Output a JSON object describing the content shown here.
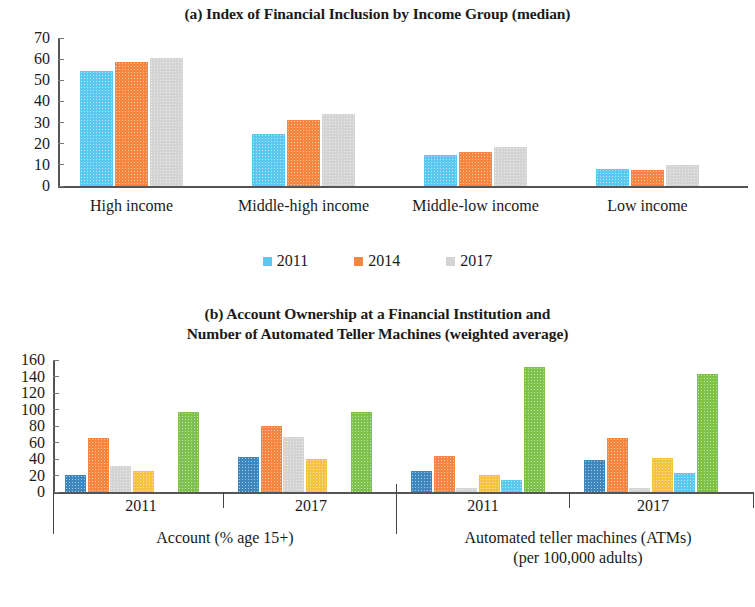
{
  "chart_data": [
    {
      "id": "panel_a",
      "type": "bar",
      "title": "(a) Index of Financial Inclusion by Income Group (median)",
      "xlabel": "",
      "ylabel": "",
      "ylim": [
        0,
        70
      ],
      "yticks": [
        0,
        10,
        20,
        30,
        40,
        50,
        60,
        70
      ],
      "grid": false,
      "legend_position": "bottom",
      "categories": [
        "High income",
        "Middle-high income",
        "Middle-low income",
        "Low income"
      ],
      "series": [
        {
          "name": "2011",
          "color": "#5BC8F0",
          "values": [
            54.3,
            24.6,
            14.8,
            7.9
          ]
        },
        {
          "name": "2014",
          "color": "#F5853F",
          "values": [
            58.8,
            31.2,
            16.2,
            7.6
          ]
        },
        {
          "name": "2017",
          "color": "#D4D4D4",
          "values": [
            60.4,
            34.2,
            18.6,
            10.1
          ]
        }
      ]
    },
    {
      "id": "panel_b",
      "type": "bar",
      "title_line1": "(b) Account Ownership at a Financial Institution and",
      "title_line2": "Number of Automated Teller Machines (weighted average)",
      "ylim": [
        0,
        160
      ],
      "yticks": [
        0,
        20,
        40,
        60,
        80,
        100,
        120,
        140,
        160
      ],
      "grid": false,
      "legend_position": "bottom",
      "groups": [
        {
          "label": "2011",
          "section": "Account (% age 15+)"
        },
        {
          "label": "2017",
          "section": "Account (% age 15+)"
        },
        {
          "label": "2011",
          "section": "Automated teller machines (ATMs) (per 100,000 adults)"
        },
        {
          "label": "2017",
          "section": "Automated teller machines (ATMs) (per 100,000 adults)"
        }
      ],
      "sections": [
        {
          "line1": "Account (% age 15+)",
          "line2": ""
        },
        {
          "line1": "Automated teller machines (ATMs)",
          "line2": "(per 100,000 adults)"
        }
      ],
      "categories": [
        "2011",
        "2017",
        "2011",
        "2017"
      ],
      "series": [
        {
          "name": "Central Asia",
          "color": "#3D87BE",
          "values": [
            21,
            42,
            26,
            39
          ]
        },
        {
          "name": "East Asia",
          "color": "#F5853F",
          "values": [
            66,
            80,
            44,
            65
          ]
        },
        {
          "name": "South Asia",
          "color": "#D4D4D4",
          "values": [
            31,
            67,
            5,
            5
          ]
        },
        {
          "name": "Southeast Asia",
          "color": "#F5C242",
          "values": [
            25,
            40,
            21,
            41
          ]
        },
        {
          "name": "The Pacific",
          "color": "#5BC8F0",
          "values": [
            0,
            0,
            15,
            23
          ]
        },
        {
          "name": "Oceania",
          "color": "#7EC24C",
          "values": [
            97,
            97,
            151,
            143
          ]
        }
      ]
    }
  ]
}
